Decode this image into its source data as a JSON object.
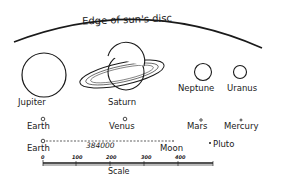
{
  "diagram": {
    "title": "Edge of sun's disc",
    "planets": [
      {
        "name": "Jupiter",
        "label": "Jupiter"
      },
      {
        "name": "Saturn",
        "label": "Saturn"
      },
      {
        "name": "Neptune",
        "label": "Neptune"
      },
      {
        "name": "Uranus",
        "label": "Uranus"
      },
      {
        "name": "Earth",
        "label": "Earth"
      },
      {
        "name": "Venus",
        "label": "Venus"
      },
      {
        "name": "Mars",
        "label": "Mars"
      },
      {
        "name": "Mercury",
        "label": "Mercury"
      },
      {
        "name": "Pluto",
        "label": "Pluto"
      }
    ],
    "earth_moon": {
      "earth_label": "Earth",
      "distance_label": "384000",
      "moon_label": "Moon"
    },
    "scale": {
      "label": "Scale",
      "ticks": [
        "0",
        "100",
        "200",
        "300",
        "400"
      ]
    },
    "colors": {
      "ink": "#1a1a1a",
      "background": "#ffffff"
    }
  }
}
